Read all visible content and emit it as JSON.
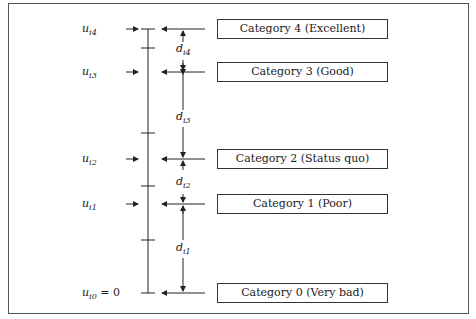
{
  "categories": [
    {
      "label": "Category 4 (Excellent)",
      "utility_label": "u",
      "utility_sub": "i4",
      "suffix": "",
      "y": 29
    },
    {
      "label": "Category 3 (Good)",
      "utility_label": "u",
      "utility_sub": "i3",
      "suffix": "",
      "y": 72
    },
    {
      "label": "Category 2 (Status quo)",
      "utility_label": "u",
      "utility_sub": "i2",
      "suffix": "",
      "y": 159
    },
    {
      "label": "Category 1 (Poor)",
      "utility_label": "u",
      "utility_sub": "i1",
      "suffix": "",
      "y": 204
    },
    {
      "label": "Category 0 (Very bad)",
      "utility_label": "u",
      "utility_sub": "i0",
      "suffix": " = 0",
      "y": 293
    }
  ],
  "distances": [
    {
      "label": "d",
      "sub": "i4",
      "y": 50
    },
    {
      "label": "d",
      "sub": "i3",
      "y": 117
    },
    {
      "label": "d",
      "sub": "i2",
      "y": 183
    },
    {
      "label": "d",
      "sub": "i1",
      "y": 248
    }
  ],
  "colors": {
    "line": "#222222",
    "frame": "#555555",
    "background": "#ffffff"
  }
}
